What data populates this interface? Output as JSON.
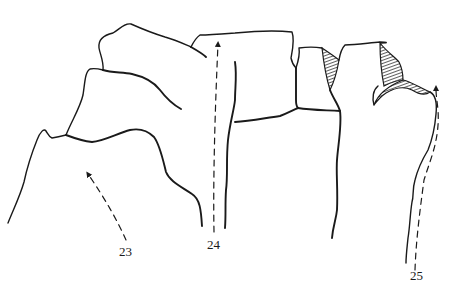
{
  "figure": {
    "type": "line-drawing",
    "colors": {
      "ink": "#1a1a1a",
      "background": "#ffffff"
    },
    "labels": [
      {
        "id": "23",
        "text": "23",
        "x": 119,
        "y": 256
      },
      {
        "id": "24",
        "text": "24",
        "x": 207,
        "y": 249
      },
      {
        "id": "25",
        "text": "25",
        "x": 410,
        "y": 280
      }
    ]
  }
}
